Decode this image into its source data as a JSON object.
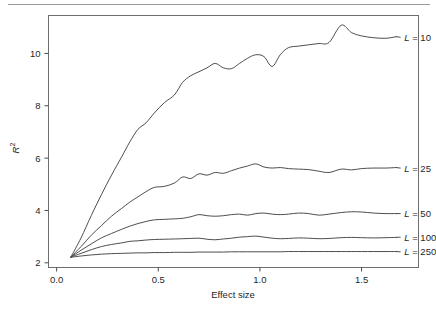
{
  "figure": {
    "has_top_rule": true,
    "background_color": "#ffffff",
    "line_color": "#3a3a3a"
  },
  "chart_data": {
    "type": "line",
    "title": "",
    "xlabel": "Effect size",
    "ylabel": "R2",
    "ylabel_display": "R",
    "ylabel_superscript": "2",
    "xlim": [
      -0.04,
      1.78
    ],
    "ylim": [
      1.82,
      11.45
    ],
    "xticks": [
      0.0,
      0.5,
      1.0,
      1.5
    ],
    "xticklabels": [
      "0.0",
      "0.5",
      "1.0",
      "1.5"
    ],
    "yticks": [
      2,
      4,
      6,
      8,
      10
    ],
    "yticklabels": [
      "2",
      "4",
      "6",
      "8",
      "10"
    ],
    "grid": false,
    "legend_position": "right-inline-labels",
    "series": [
      {
        "name": "L = 10",
        "label_prefix": "L",
        "label_value": "10",
        "label_text": "L = 10",
        "label_x": 1.7,
        "label_y": 10.62,
        "x": [
          0.07,
          0.12,
          0.17,
          0.22,
          0.27,
          0.32,
          0.36,
          0.4,
          0.44,
          0.48,
          0.53,
          0.58,
          0.62,
          0.66,
          0.7,
          0.74,
          0.78,
          0.82,
          0.86,
          0.9,
          0.94,
          0.98,
          1.02,
          1.06,
          1.1,
          1.14,
          1.19,
          1.24,
          1.29,
          1.34,
          1.4,
          1.45,
          1.5,
          1.56,
          1.62,
          1.67
        ],
        "y": [
          2.22,
          2.95,
          3.8,
          4.6,
          5.35,
          6.05,
          6.62,
          7.1,
          7.35,
          7.72,
          8.12,
          8.42,
          8.9,
          9.15,
          9.3,
          9.45,
          9.62,
          9.45,
          9.42,
          9.62,
          9.82,
          9.95,
          9.88,
          9.5,
          9.95,
          10.22,
          10.28,
          10.33,
          10.38,
          10.42,
          11.08,
          10.8,
          10.67,
          10.6,
          10.58,
          10.64
        ]
      },
      {
        "name": "L = 25",
        "label_prefix": "L",
        "label_value": "25",
        "label_text": "L = 25",
        "label_x": 1.7,
        "label_y": 5.62,
        "x": [
          0.07,
          0.12,
          0.17,
          0.22,
          0.27,
          0.32,
          0.36,
          0.4,
          0.44,
          0.48,
          0.53,
          0.58,
          0.62,
          0.66,
          0.7,
          0.74,
          0.78,
          0.82,
          0.86,
          0.9,
          0.94,
          0.98,
          1.02,
          1.06,
          1.1,
          1.14,
          1.19,
          1.24,
          1.29,
          1.34,
          1.4,
          1.45,
          1.5,
          1.56,
          1.62,
          1.67
        ],
        "y": [
          2.22,
          2.62,
          3.05,
          3.42,
          3.78,
          4.08,
          4.32,
          4.52,
          4.72,
          4.88,
          4.92,
          5.05,
          5.28,
          5.22,
          5.4,
          5.35,
          5.45,
          5.42,
          5.52,
          5.62,
          5.7,
          5.78,
          5.66,
          5.62,
          5.64,
          5.6,
          5.58,
          5.56,
          5.5,
          5.45,
          5.58,
          5.55,
          5.6,
          5.62,
          5.62,
          5.64
        ]
      },
      {
        "name": "L = 50",
        "label_prefix": "L",
        "label_value": "50",
        "label_text": "L = 50",
        "label_x": 1.7,
        "label_y": 3.88,
        "x": [
          0.07,
          0.12,
          0.17,
          0.22,
          0.27,
          0.32,
          0.36,
          0.4,
          0.44,
          0.48,
          0.53,
          0.58,
          0.62,
          0.66,
          0.7,
          0.74,
          0.78,
          0.82,
          0.86,
          0.9,
          0.94,
          0.98,
          1.02,
          1.06,
          1.1,
          1.14,
          1.19,
          1.24,
          1.29,
          1.34,
          1.4,
          1.45,
          1.5,
          1.56,
          1.62,
          1.67
        ],
        "y": [
          2.22,
          2.48,
          2.72,
          2.95,
          3.12,
          3.28,
          3.4,
          3.5,
          3.58,
          3.64,
          3.66,
          3.68,
          3.7,
          3.76,
          3.84,
          3.8,
          3.78,
          3.8,
          3.84,
          3.86,
          3.82,
          3.88,
          3.9,
          3.86,
          3.84,
          3.86,
          3.9,
          3.88,
          3.82,
          3.86,
          3.92,
          3.95,
          3.94,
          3.9,
          3.88,
          3.88
        ]
      },
      {
        "name": "L = 100",
        "label_prefix": "L",
        "label_value": "100",
        "label_text": "L = 100",
        "label_x": 1.7,
        "label_y": 2.98,
        "x": [
          0.07,
          0.12,
          0.17,
          0.22,
          0.27,
          0.32,
          0.36,
          0.4,
          0.44,
          0.48,
          0.53,
          0.58,
          0.62,
          0.66,
          0.7,
          0.74,
          0.78,
          0.82,
          0.86,
          0.9,
          0.94,
          0.98,
          1.02,
          1.06,
          1.1,
          1.14,
          1.19,
          1.24,
          1.29,
          1.34,
          1.4,
          1.45,
          1.5,
          1.56,
          1.62,
          1.67
        ],
        "y": [
          2.22,
          2.36,
          2.5,
          2.62,
          2.7,
          2.76,
          2.82,
          2.84,
          2.87,
          2.89,
          2.9,
          2.91,
          2.92,
          2.93,
          2.94,
          2.9,
          2.88,
          2.91,
          2.94,
          2.98,
          3.0,
          3.02,
          2.98,
          2.94,
          2.92,
          2.93,
          2.95,
          2.94,
          2.92,
          2.93,
          2.96,
          2.97,
          2.96,
          2.95,
          2.96,
          2.97
        ]
      },
      {
        "name": "L = 250",
        "label_prefix": "L",
        "label_value": "250",
        "label_text": "L = 250",
        "label_x": 1.7,
        "label_y": 2.42,
        "x": [
          0.07,
          0.12,
          0.17,
          0.22,
          0.27,
          0.32,
          0.36,
          0.4,
          0.44,
          0.48,
          0.53,
          0.58,
          0.62,
          0.66,
          0.7,
          0.74,
          0.78,
          0.82,
          0.86,
          0.9,
          0.94,
          0.98,
          1.02,
          1.06,
          1.1,
          1.14,
          1.19,
          1.24,
          1.29,
          1.34,
          1.4,
          1.45,
          1.5,
          1.56,
          1.62,
          1.67
        ],
        "y": [
          2.21,
          2.26,
          2.3,
          2.33,
          2.35,
          2.36,
          2.37,
          2.38,
          2.38,
          2.39,
          2.39,
          2.4,
          2.4,
          2.4,
          2.41,
          2.41,
          2.41,
          2.41,
          2.42,
          2.42,
          2.42,
          2.42,
          2.42,
          2.42,
          2.42,
          2.43,
          2.43,
          2.43,
          2.43,
          2.43,
          2.43,
          2.43,
          2.43,
          2.43,
          2.43,
          2.43
        ]
      }
    ]
  }
}
